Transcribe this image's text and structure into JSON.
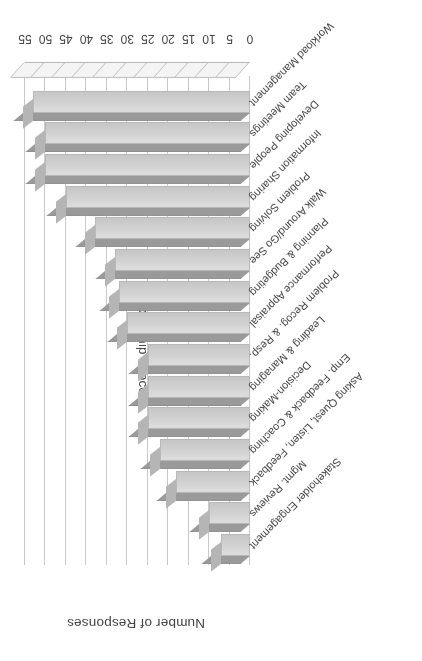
{
  "chart_data": {
    "type": "bar",
    "orientation": "horizontal-3d",
    "title": "",
    "xlabel": "Leadership Process",
    "ylabel": "Number of Responses",
    "ylim": [
      0,
      55
    ],
    "ytick_step": 5,
    "yticks": [
      "0",
      "5",
      "10",
      "15",
      "20",
      "25",
      "30",
      "35",
      "40",
      "45",
      "50",
      "55"
    ],
    "grid": true,
    "legend": false,
    "categories": [
      "Workload Management",
      "Team Meetings",
      "Developing People",
      "Information Sharing",
      "Problem Solving",
      "Walk Around/Go See",
      "Planning & Budgeting",
      "Performance Appraisal",
      "Problem Recog. & Resp.",
      "Leading & Managing",
      "Decision-Making",
      "Emp. Feedback & Coaching",
      "Asking Quest, Listen, Feedback",
      "Mgmt. Reviews",
      "Stakeholder Engagement"
    ],
    "values": [
      53,
      50,
      50,
      45,
      38,
      33,
      32,
      30,
      25,
      25,
      25,
      22,
      18,
      10,
      7
    ],
    "series_name": "Number of Responses",
    "colors": {
      "bar_face": "#d2d2d2",
      "bar_top": "#9a9a9a",
      "bar_side": "#b5b5b5",
      "gridline": "#c9c9c9",
      "text": "#3f3f3f",
      "background": "#ffffff"
    }
  }
}
